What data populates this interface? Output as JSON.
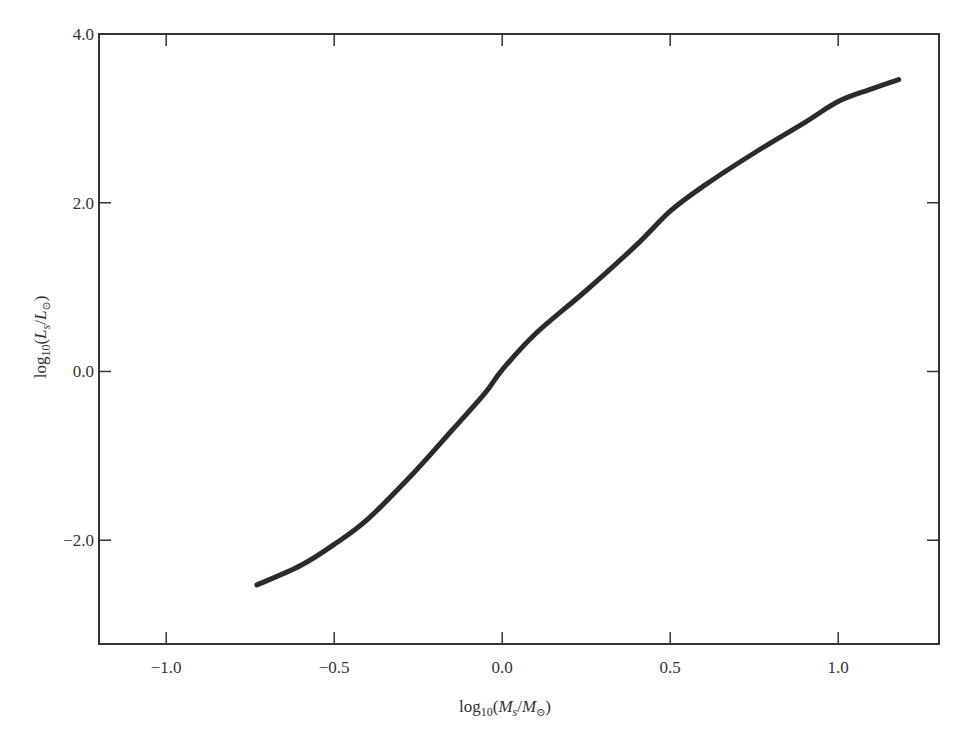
{
  "chart_data": {
    "type": "line",
    "title": "",
    "xlabel": "log10(Ms/M⊙)",
    "ylabel": "log10(Ls/L⊙)",
    "xlabel_parts": {
      "pre": "log",
      "sub": "10",
      "open": "(",
      "var1": "M",
      "sub1": "s",
      "slash": "/",
      "var2": "M",
      "sub2": "⊙",
      "close": ")"
    },
    "ylabel_parts": {
      "pre": "log",
      "sub": "10",
      "open": "(",
      "var1": "L",
      "sub1": "s",
      "slash": "/",
      "var2": "L",
      "sub2": "⊙",
      "close": ")"
    },
    "xlim": [
      -1.2,
      1.3
    ],
    "ylim": [
      -3.23,
      4.0
    ],
    "xticks": [
      -1.0,
      -0.5,
      0.0,
      0.5,
      1.0
    ],
    "xtick_labels": [
      "−1.0",
      "−0.5",
      "0.0",
      "0.5",
      "1.0"
    ],
    "yticks": [
      -2.0,
      0.0,
      2.0,
      4.0
    ],
    "ytick_labels": [
      "−2.0",
      "0.0",
      "2.0",
      "4.0"
    ],
    "grid": false,
    "legend": null,
    "series": [
      {
        "name": "mass-luminosity relation",
        "color": "#2b2b2b",
        "x": [
          -0.73,
          -0.6,
          -0.5,
          -0.4,
          -0.27,
          -0.15,
          -0.05,
          0.0,
          0.1,
          0.25,
          0.4,
          0.5,
          0.6,
          0.75,
          0.9,
          1.0,
          1.1,
          1.18
        ],
        "y": [
          -2.53,
          -2.3,
          -2.05,
          -1.75,
          -1.23,
          -0.7,
          -0.25,
          0.02,
          0.45,
          0.96,
          1.5,
          1.9,
          2.2,
          2.59,
          2.95,
          3.2,
          3.35,
          3.46
        ]
      }
    ]
  }
}
